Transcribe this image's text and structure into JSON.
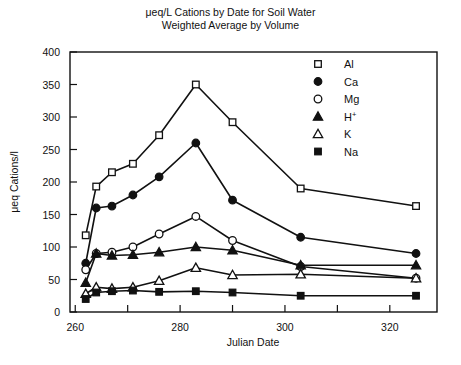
{
  "chart_data": {
    "type": "line",
    "title": "μeq/L Cations by Date for Soil Water",
    "subtitle": "Weighted Average by Volume",
    "xlabel": "Julian Date",
    "ylabel": "μeq Cations/l",
    "xlim": [
      259,
      329
    ],
    "ylim": [
      0,
      400
    ],
    "xticks": [
      260,
      270,
      280,
      290,
      300,
      310,
      320
    ],
    "xtick_labels": [
      "260",
      "",
      "280",
      "",
      "300",
      "",
      "320"
    ],
    "yticks": [
      0,
      50,
      100,
      150,
      200,
      250,
      300,
      350,
      400
    ],
    "ytick_labels": [
      "0",
      "50",
      "100",
      "150",
      "200",
      "250",
      "300",
      "350",
      "400"
    ],
    "grid": false,
    "legend_position": "upper right",
    "x": [
      262,
      264,
      267,
      271,
      276,
      283,
      290,
      303,
      325
    ],
    "series": [
      {
        "name": "Al",
        "marker": "open-square",
        "values": [
          118,
          193,
          215,
          228,
          272,
          350,
          292,
          190,
          163
        ]
      },
      {
        "name": "Ca",
        "marker": "filled-circle",
        "values": [
          75,
          160,
          163,
          180,
          208,
          260,
          172,
          115,
          90
        ]
      },
      {
        "name": "Mg",
        "marker": "open-circle",
        "values": [
          65,
          90,
          92,
          100,
          120,
          147,
          110,
          70,
          52
        ]
      },
      {
        "name": "H+",
        "marker": "filled-triangle",
        "values": [
          45,
          90,
          87,
          88,
          92,
          100,
          95,
          72,
          72
        ]
      },
      {
        "name": "K",
        "marker": "open-triangle",
        "values": [
          28,
          38,
          36,
          38,
          48,
          68,
          57,
          58,
          52
        ]
      },
      {
        "name": "Na",
        "marker": "filled-square",
        "values": [
          20,
          30,
          32,
          33,
          31,
          32,
          30,
          25,
          25
        ]
      }
    ]
  },
  "legend": {
    "entries": [
      {
        "label": "Al",
        "sup": ""
      },
      {
        "label": "Ca",
        "sup": ""
      },
      {
        "label": "Mg",
        "sup": ""
      },
      {
        "label": "H",
        "sup": "+"
      },
      {
        "label": "K",
        "sup": ""
      },
      {
        "label": "Na",
        "sup": ""
      }
    ]
  },
  "colors": {
    "ink": "#111111",
    "background": "#ffffff"
  }
}
